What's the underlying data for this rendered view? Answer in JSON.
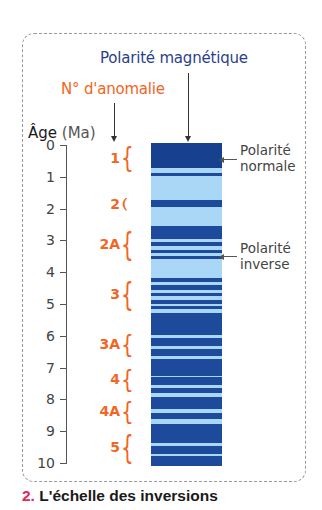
{
  "figure": {
    "title_polarity": "Polarité magnétique",
    "title_anomaly": "N° d'anomalie",
    "age_axis_label": "Âge",
    "age_axis_unit": "(Ma)",
    "callout_normal": [
      "Polarité",
      "normale"
    ],
    "callout_inverse": [
      "Polarité",
      "inverse"
    ],
    "caption_number": "2.",
    "caption_text": "L'échelle des inversions"
  },
  "colors": {
    "normal_polarity": "#1e4a9c",
    "inverse_polarity": "#a9d7f5",
    "anomaly_orange": "#f26522",
    "title_blue": "#2c3f8c",
    "caption_red": "#e5255b"
  },
  "chart_data": {
    "type": "stratigraphic-column",
    "title": "L'échelle des inversions",
    "ylabel": "Âge (Ma)",
    "ylim": [
      0,
      10
    ],
    "ticks": [
      0,
      1,
      2,
      3,
      4,
      5,
      6,
      7,
      8,
      9,
      10
    ],
    "anomalies": [
      {
        "label": "1",
        "from": 0.0,
        "to": 0.8
      },
      {
        "label": "2",
        "from": 1.75,
        "to": 1.95
      },
      {
        "label": "2A",
        "from": 2.6,
        "to": 3.6
      },
      {
        "label": "3",
        "from": 4.2,
        "to": 5.2
      },
      {
        "label": "3A",
        "from": 5.9,
        "to": 6.6
      },
      {
        "label": "4",
        "from": 7.0,
        "to": 7.7
      },
      {
        "label": "4A",
        "from": 8.0,
        "to": 8.7
      },
      {
        "label": "5",
        "from": 9.0,
        "to": 10.0
      }
    ],
    "normal_intervals": [
      [
        0.0,
        0.78
      ],
      [
        0.93,
        1.02
      ],
      [
        1.78,
        1.98
      ],
      [
        2.58,
        2.98
      ],
      [
        3.05,
        3.2
      ],
      [
        3.3,
        3.4
      ],
      [
        3.5,
        3.58
      ],
      [
        4.18,
        4.3
      ],
      [
        4.4,
        4.55
      ],
      [
        4.65,
        4.75
      ],
      [
        4.85,
        4.97
      ],
      [
        5.05,
        5.15
      ],
      [
        5.25,
        5.95
      ],
      [
        6.05,
        6.3
      ],
      [
        6.38,
        6.6
      ],
      [
        6.7,
        7.2
      ],
      [
        7.25,
        7.5
      ],
      [
        7.6,
        7.75
      ],
      [
        7.85,
        8.25
      ],
      [
        8.35,
        8.55
      ],
      [
        8.7,
        9.3
      ],
      [
        9.38,
        9.62
      ],
      [
        9.7,
        10.0
      ]
    ],
    "legend": [
      {
        "label": "Polarité normale",
        "color": "#1e4a9c"
      },
      {
        "label": "Polarité inverse",
        "color": "#a9d7f5"
      }
    ]
  }
}
